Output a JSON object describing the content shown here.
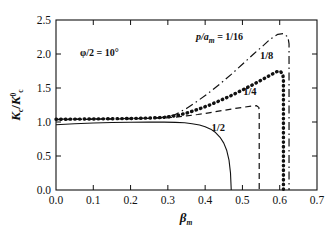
{
  "chart_data": {
    "type": "line",
    "title": "",
    "xlabel": "βm",
    "xlabel_base": "β",
    "xlabel_sub": "m",
    "ylabel": "Kc/K⁰c",
    "ylabel_parts": {
      "k1": "K",
      "sub1": "c",
      "slash": "/",
      "k2": "K",
      "sup2": "0",
      "sub2": "c"
    },
    "xlim": [
      0.0,
      0.7
    ],
    "ylim": [
      0.0,
      2.5
    ],
    "xticks": [
      "0.0",
      "0.1",
      "0.2",
      "0.3",
      "0.4",
      "0.5",
      "0.6",
      "0.7"
    ],
    "xtick_values": [
      0.0,
      0.1,
      0.2,
      0.3,
      0.4,
      0.5,
      0.6,
      0.7
    ],
    "yticks": [
      "0.0",
      "0.5",
      "1.0",
      "1.5",
      "2.0",
      "2.5"
    ],
    "ytick_values": [
      0.0,
      0.5,
      1.0,
      1.5,
      2.0,
      2.5
    ],
    "grid": false,
    "legend_position": "inline-annotations",
    "annotations": [
      {
        "name": "phi-annotation",
        "text": "φ/2 = 10°",
        "x": 0.09,
        "y": 2.07
      },
      {
        "name": "ratio-annotation",
        "prefix": "p/a",
        "sub": "m",
        "suffix": " = 1/16",
        "x": 0.425,
        "y": 2.22
      }
    ],
    "series": [
      {
        "name": "1/16",
        "label": "p/a_m = 1/16",
        "style": "dashdot",
        "color": "#111111",
        "label_pos": {
          "x": 0.425,
          "y": 2.22
        },
        "peak": {
          "x": 0.6,
          "y": 2.3
        },
        "dropoff_x": 0.625,
        "points": [
          [
            0.0,
            1.04
          ],
          [
            0.05,
            1.042
          ],
          [
            0.1,
            1.045
          ],
          [
            0.15,
            1.048
          ],
          [
            0.2,
            1.052
          ],
          [
            0.25,
            1.058
          ],
          [
            0.29,
            1.07
          ],
          [
            0.32,
            1.11
          ],
          [
            0.35,
            1.2
          ],
          [
            0.38,
            1.31
          ],
          [
            0.41,
            1.43
          ],
          [
            0.44,
            1.56
          ],
          [
            0.47,
            1.7
          ],
          [
            0.5,
            1.85
          ],
          [
            0.53,
            2.0
          ],
          [
            0.555,
            2.12
          ],
          [
            0.575,
            2.22
          ],
          [
            0.595,
            2.29
          ],
          [
            0.61,
            2.3
          ],
          [
            0.622,
            2.25
          ],
          [
            0.625,
            2.15
          ],
          [
            0.625,
            0.0
          ]
        ]
      },
      {
        "name": "1/8",
        "label": "1/8",
        "style": "dotted",
        "color": "#111111",
        "label_pos": {
          "x": 0.565,
          "y": 1.92
        },
        "peak": {
          "x": 0.6,
          "y": 1.745
        },
        "dropoff_x": 0.61,
        "points": [
          [
            0.0,
            1.04
          ],
          [
            0.05,
            1.042
          ],
          [
            0.1,
            1.045
          ],
          [
            0.15,
            1.048
          ],
          [
            0.2,
            1.052
          ],
          [
            0.25,
            1.058
          ],
          [
            0.29,
            1.068
          ],
          [
            0.32,
            1.09
          ],
          [
            0.35,
            1.13
          ],
          [
            0.38,
            1.185
          ],
          [
            0.41,
            1.245
          ],
          [
            0.44,
            1.315
          ],
          [
            0.47,
            1.39
          ],
          [
            0.5,
            1.47
          ],
          [
            0.53,
            1.555
          ],
          [
            0.555,
            1.63
          ],
          [
            0.575,
            1.69
          ],
          [
            0.592,
            1.74
          ],
          [
            0.602,
            1.745
          ],
          [
            0.608,
            1.7
          ],
          [
            0.61,
            1.64
          ],
          [
            0.61,
            0.0
          ]
        ]
      },
      {
        "name": "1/4",
        "label": "1/4",
        "style": "dashed",
        "color": "#111111",
        "label_pos": {
          "x": 0.52,
          "y": 1.395
        },
        "peak": {
          "x": 0.535,
          "y": 1.24
        },
        "dropoff_x": 0.545,
        "points": [
          [
            0.0,
            1.035
          ],
          [
            0.05,
            1.037
          ],
          [
            0.1,
            1.04
          ],
          [
            0.15,
            1.043
          ],
          [
            0.2,
            1.047
          ],
          [
            0.25,
            1.052
          ],
          [
            0.29,
            1.06
          ],
          [
            0.32,
            1.072
          ],
          [
            0.35,
            1.09
          ],
          [
            0.38,
            1.11
          ],
          [
            0.41,
            1.135
          ],
          [
            0.44,
            1.163
          ],
          [
            0.47,
            1.19
          ],
          [
            0.5,
            1.215
          ],
          [
            0.525,
            1.235
          ],
          [
            0.538,
            1.24
          ],
          [
            0.544,
            1.215
          ],
          [
            0.545,
            1.15
          ],
          [
            0.545,
            0.0
          ]
        ]
      },
      {
        "name": "1/2",
        "label": "1/2",
        "style": "solid",
        "color": "#111111",
        "label_pos": {
          "x": 0.435,
          "y": 0.865
        },
        "dropoff_x": 0.47,
        "points": [
          [
            0.0,
            0.96
          ],
          [
            0.05,
            0.975
          ],
          [
            0.1,
            0.985
          ],
          [
            0.15,
            0.992
          ],
          [
            0.2,
            0.996
          ],
          [
            0.25,
            0.998
          ],
          [
            0.29,
            0.998
          ],
          [
            0.32,
            0.995
          ],
          [
            0.345,
            0.988
          ],
          [
            0.365,
            0.975
          ],
          [
            0.385,
            0.955
          ],
          [
            0.4,
            0.93
          ],
          [
            0.415,
            0.895
          ],
          [
            0.428,
            0.845
          ],
          [
            0.44,
            0.775
          ],
          [
            0.45,
            0.69
          ],
          [
            0.458,
            0.58
          ],
          [
            0.464,
            0.44
          ],
          [
            0.468,
            0.25
          ],
          [
            0.47,
            0.0
          ]
        ]
      }
    ]
  }
}
